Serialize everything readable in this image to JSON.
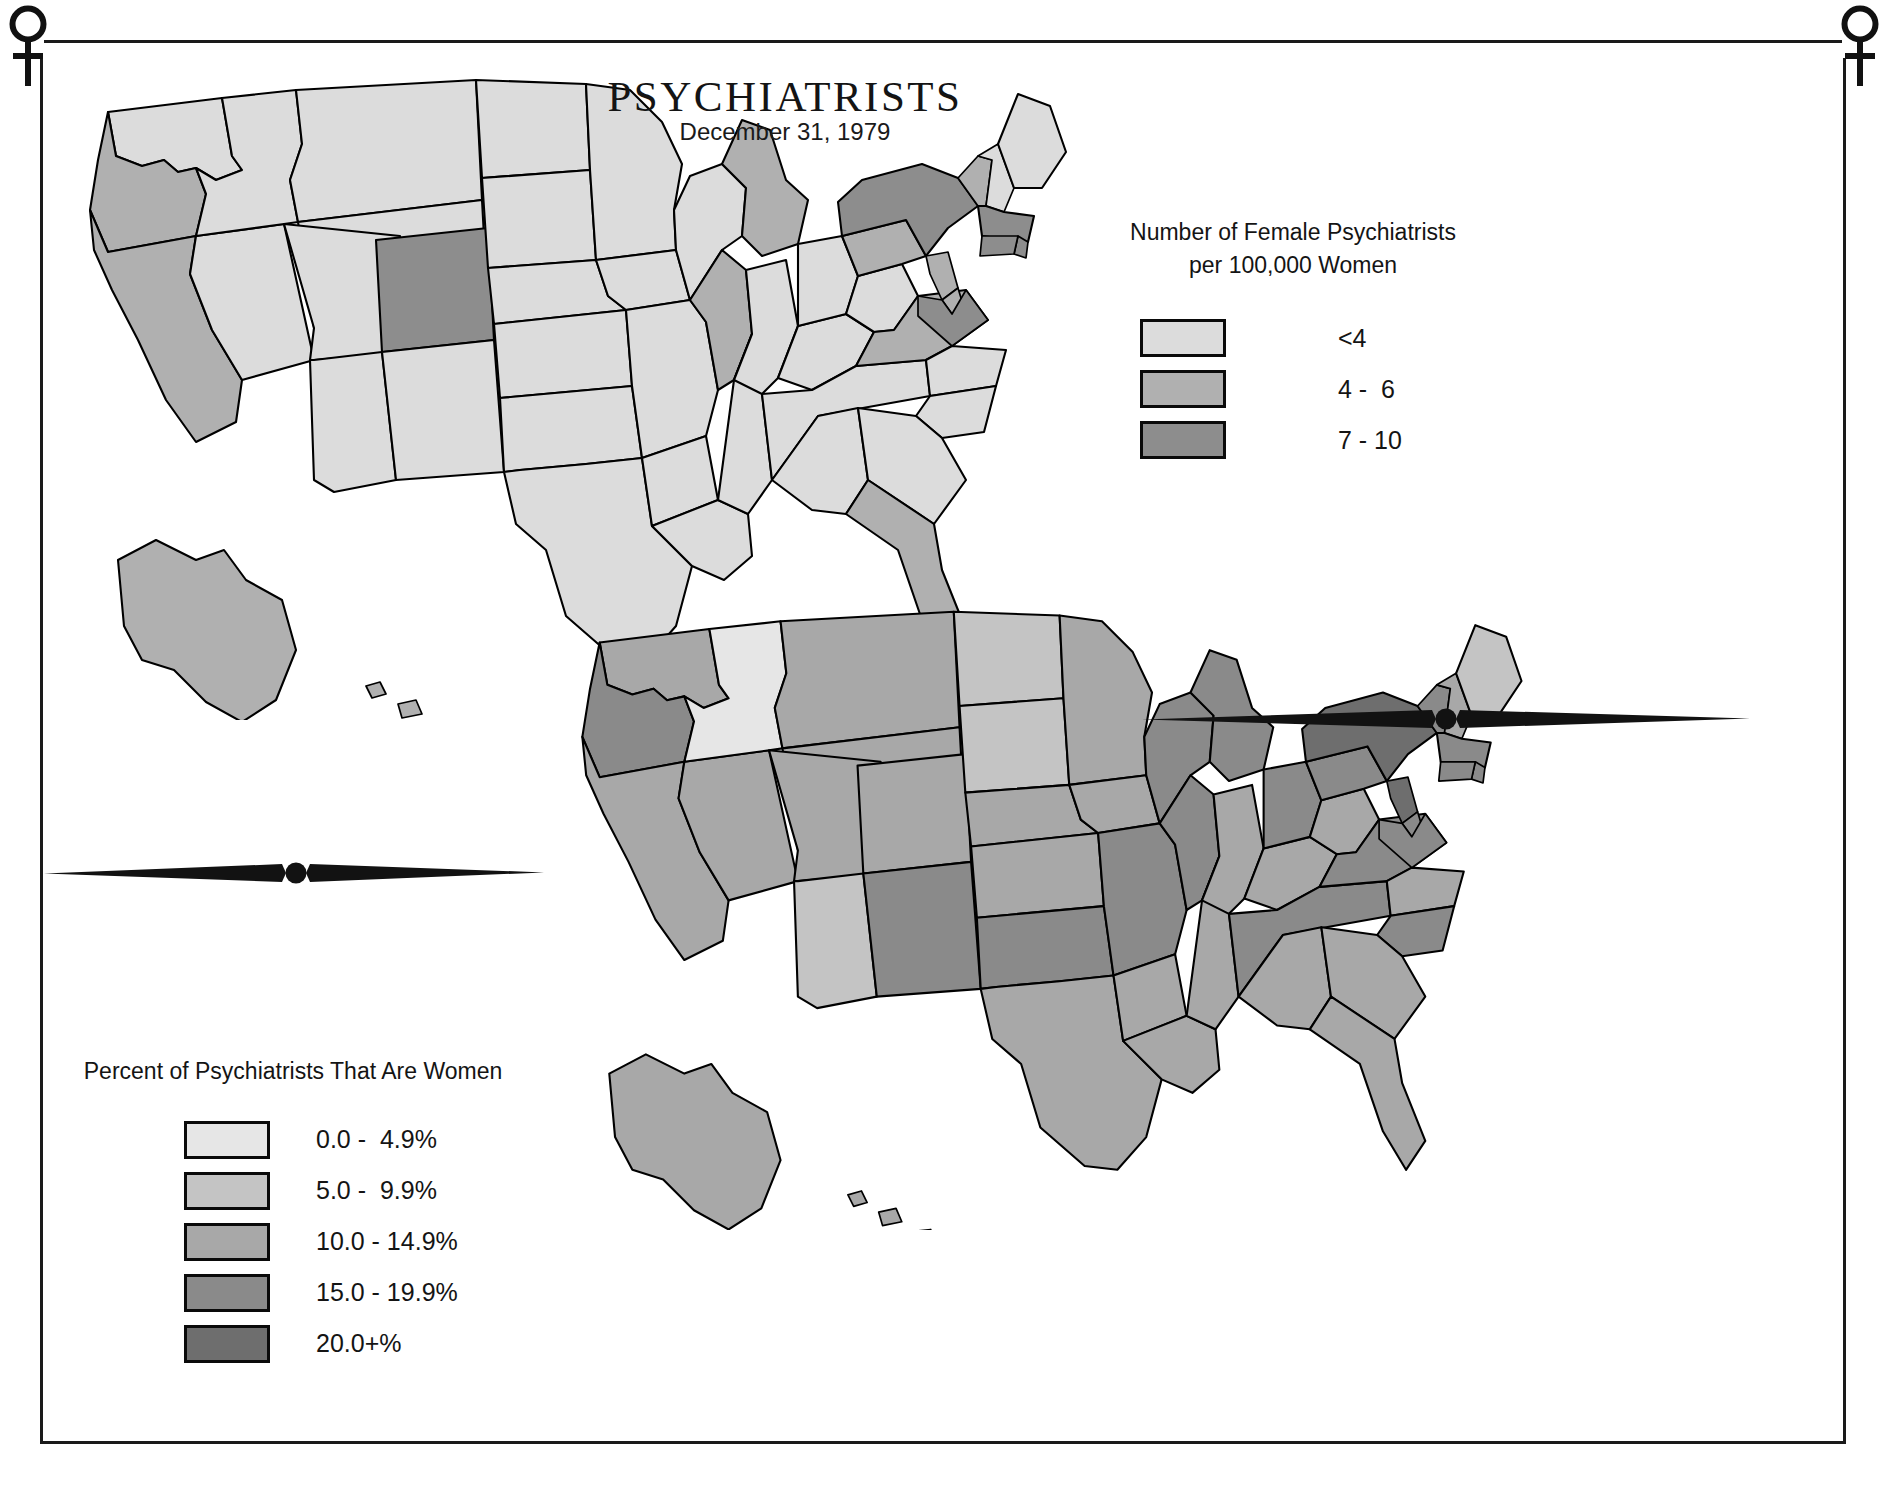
{
  "page": {
    "title": "PSYCHIATRISTS",
    "subtitle": "December 31, 1979"
  },
  "ornaments": {
    "top_left_symbol": "venus-symbol",
    "top_right_symbol": "venus-symbol",
    "divider_left": "spear-divider-ornament",
    "divider_right": "spear-divider-ornament"
  },
  "legend_top": {
    "title_line1": "Number of Female Psychiatrists",
    "title_line2": "per 100,000 Women",
    "items": [
      {
        "label": "<4",
        "color": "#dcdcdc"
      },
      {
        "label": "4 -  6",
        "color": "#b0b0b0"
      },
      {
        "label": "7 - 10",
        "color": "#8d8d8d"
      }
    ]
  },
  "legend_bottom": {
    "title_line1": "Percent of Psychiatrists That Are Women",
    "title_line2": "",
    "items": [
      {
        "label": "0.0 -  4.9%",
        "color": "#e6e6e6"
      },
      {
        "label": "5.0 -  9.9%",
        "color": "#c4c4c4"
      },
      {
        "label": "10.0 - 14.9%",
        "color": "#a8a8a8"
      },
      {
        "label": "15.0 - 19.9%",
        "color": "#8a8a8a"
      },
      {
        "label": "20.0+%",
        "color": "#6e6e6e"
      }
    ]
  },
  "chart_data": {
    "type": "map",
    "title": "PSYCHIATRISTS",
    "subtitle": "December 31, 1979",
    "panels": [
      {
        "name": "upper-map",
        "measure": "Number of Female Psychiatrists per 100,000 Women",
        "classes": [
          "<4",
          "4 -  6",
          "7 - 10"
        ],
        "class_colors": [
          "#dcdcdc",
          "#b0b0b0",
          "#8d8d8d"
        ],
        "states": {
          "WA": "<4",
          "OR": "4 -  6",
          "CA": "4 -  6",
          "NV": "<4",
          "ID": "<4",
          "MT": "<4",
          "WY": "<4",
          "UT": "<4",
          "AZ": "<4",
          "CO": "7 - 10",
          "NM": "<4",
          "ND": "<4",
          "SD": "<4",
          "NE": "<4",
          "KS": "<4",
          "OK": "<4",
          "TX": "<4",
          "MN": "<4",
          "IA": "<4",
          "MO": "<4",
          "AR": "<4",
          "LA": "<4",
          "WI": "<4",
          "IL": "4 -  6",
          "MS": "<4",
          "MI": "4 -  6",
          "IN": "<4",
          "KY": "<4",
          "TN": "<4",
          "AL": "<4",
          "OH": "<4",
          "WV": "<4",
          "VA": "4 -  6",
          "NC": "<4",
          "SC": "<4",
          "GA": "<4",
          "FL": "4 -  6",
          "PA": "4 -  6",
          "NY": "7 - 10",
          "VT": "4 -  6",
          "NH": "<4",
          "ME": "<4",
          "MA": "7 - 10",
          "RI": "7 - 10",
          "CT": "7 - 10",
          "NJ": "4 -  6",
          "DE": "4 -  6",
          "MD": "7 - 10",
          "DC": "7 - 10",
          "AK": "4 -  6",
          "HI": "4 -  6"
        }
      },
      {
        "name": "lower-map",
        "measure": "Percent of Psychiatrists That Are Women",
        "classes": [
          "0.0 -  4.9%",
          "5.0 -  9.9%",
          "10.0 - 14.9%",
          "15.0 - 19.9%",
          "20.0+%"
        ],
        "class_colors": [
          "#e6e6e6",
          "#c4c4c4",
          "#a8a8a8",
          "#8a8a8a",
          "#6e6e6e"
        ],
        "states": {
          "WA": "10.0 - 14.9%",
          "OR": "15.0 - 19.9%",
          "CA": "10.0 - 14.9%",
          "NV": "10.0 - 14.9%",
          "ID": "0.0 -  4.9%",
          "MT": "10.0 - 14.9%",
          "WY": "10.0 - 14.9%",
          "UT": "10.0 - 14.9%",
          "AZ": "5.0 -  9.9%",
          "CO": "10.0 - 14.9%",
          "NM": "15.0 - 19.9%",
          "ND": "5.0 -  9.9%",
          "SD": "5.0 -  9.9%",
          "NE": "10.0 - 14.9%",
          "KS": "10.0 - 14.9%",
          "OK": "15.0 - 19.9%",
          "TX": "10.0 - 14.9%",
          "MN": "10.0 - 14.9%",
          "IA": "10.0 - 14.9%",
          "MO": "15.0 - 19.9%",
          "AR": "10.0 - 14.9%",
          "LA": "10.0 - 14.9%",
          "WI": "15.0 - 19.9%",
          "IL": "15.0 - 19.9%",
          "MS": "10.0 - 14.9%",
          "MI": "15.0 - 19.9%",
          "IN": "10.0 - 14.9%",
          "KY": "10.0 - 14.9%",
          "TN": "15.0 - 19.9%",
          "AL": "10.0 - 14.9%",
          "OH": "15.0 - 19.9%",
          "WV": "10.0 - 14.9%",
          "VA": "15.0 - 19.9%",
          "NC": "10.0 - 14.9%",
          "SC": "15.0 - 19.9%",
          "GA": "10.0 - 14.9%",
          "FL": "10.0 - 14.9%",
          "PA": "15.0 - 19.9%",
          "NY": "20.0+%",
          "VT": "15.0 - 19.9%",
          "NH": "10.0 - 14.9%",
          "ME": "5.0 -  9.9%",
          "MA": "15.0 - 19.9%",
          "RI": "15.0 - 19.9%",
          "CT": "15.0 - 19.9%",
          "NJ": "20.0+%",
          "DE": "15.0 - 19.9%",
          "MD": "15.0 - 19.9%",
          "DC": "20.0+%",
          "AK": "10.0 - 14.9%",
          "HI": "10.0 - 14.9%"
        }
      }
    ]
  }
}
